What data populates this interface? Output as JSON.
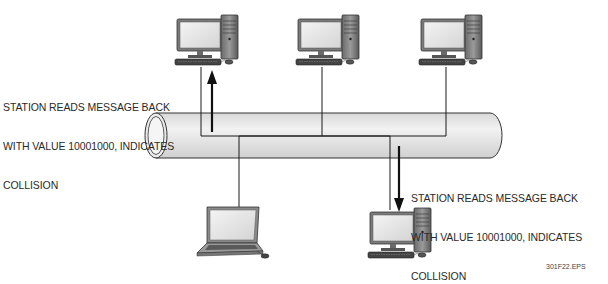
{
  "annotations": {
    "top_left": {
      "lines": [
        "STATION READS MESSAGE BACK",
        "WITH VALUE 10001000, INDICATES",
        "COLLISION"
      ]
    },
    "bottom_right": {
      "lines": [
        "STATION READS MESSAGE BACK",
        "WITH VALUE 10001000, INDICATES",
        "COLLISION"
      ]
    }
  },
  "figure_id": "301F22.EPS",
  "nodes": [
    {
      "type": "desktop-computer",
      "position": "top-left"
    },
    {
      "type": "desktop-computer",
      "position": "top-center"
    },
    {
      "type": "desktop-computer",
      "position": "top-right"
    },
    {
      "type": "laptop-computer",
      "position": "bottom-left"
    },
    {
      "type": "desktop-computer",
      "position": "bottom-right"
    }
  ],
  "arrows": [
    {
      "direction": "up",
      "from": "bus",
      "to": "top-left computer"
    },
    {
      "direction": "down",
      "from": "bus",
      "to": "bottom-right computer"
    }
  ],
  "colors": {
    "bus_fill": "#e6e6e6",
    "line": "#1a1a1a"
  }
}
